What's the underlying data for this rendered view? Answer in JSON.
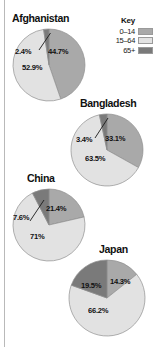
{
  "figure": {
    "legend": {
      "title": "Key",
      "items": [
        {
          "label": "0–14",
          "color": "#a9a9a9"
        },
        {
          "label": "15–64",
          "color": "#e2e2e2"
        },
        {
          "label": "65+",
          "color": "#7a7a7a"
        }
      ]
    },
    "charts": [
      {
        "title": "Afghanistan",
        "labels": [
          "44.7%",
          "52.9%",
          "2.4%"
        ]
      },
      {
        "title": "Bangladesh",
        "labels": [
          "33.1%",
          "63.5%",
          "3.4%"
        ]
      },
      {
        "title": "China",
        "labels": [
          "21.4%",
          "71%",
          "7.6%"
        ]
      },
      {
        "title": "Japan",
        "labels": [
          "14.3%",
          "66.2%",
          "19.5%"
        ]
      }
    ]
  },
  "chart_data": [
    {
      "type": "pie",
      "title": "Afghanistan",
      "categories": [
        "0–14",
        "15–64",
        "65+"
      ],
      "values": [
        44.7,
        52.9,
        2.4
      ],
      "labels": [
        "44.7%",
        "52.9%",
        "2.4%"
      ],
      "colors": [
        "#a9a9a9",
        "#e2e2e2",
        "#7a7a7a"
      ],
      "units": "percent",
      "legend": "Key"
    },
    {
      "type": "pie",
      "title": "Bangladesh",
      "categories": [
        "0–14",
        "15–64",
        "65+"
      ],
      "values": [
        33.1,
        63.5,
        3.4
      ],
      "labels": [
        "33.1%",
        "63.5%",
        "3.4%"
      ],
      "colors": [
        "#a9a9a9",
        "#e2e2e2",
        "#7a7a7a"
      ],
      "units": "percent",
      "legend": "Key"
    },
    {
      "type": "pie",
      "title": "China",
      "categories": [
        "0–14",
        "15–64",
        "65+"
      ],
      "values": [
        21.4,
        71.0,
        7.6
      ],
      "labels": [
        "21.4%",
        "71%",
        "7.6%"
      ],
      "colors": [
        "#a9a9a9",
        "#e2e2e2",
        "#7a7a7a"
      ],
      "units": "percent",
      "legend": "Key"
    },
    {
      "type": "pie",
      "title": "Japan",
      "categories": [
        "0–14",
        "15–64",
        "65+"
      ],
      "values": [
        14.3,
        66.2,
        19.5
      ],
      "labels": [
        "14.3%",
        "66.2%",
        "19.5%"
      ],
      "colors": [
        "#a9a9a9",
        "#e2e2e2",
        "#7a7a7a"
      ],
      "units": "percent",
      "legend": "Key"
    }
  ]
}
